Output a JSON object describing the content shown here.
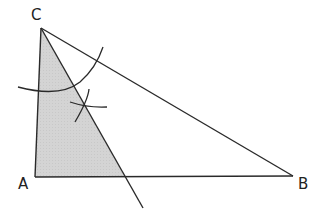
{
  "diagram": {
    "type": "geometric-construction",
    "vertices": {
      "A": {
        "label": "A"
      },
      "B": {
        "label": "B"
      },
      "C": {
        "label": "C"
      }
    },
    "shaded_region_color": "#d4d4d4",
    "line_color": "#2a2a2a"
  }
}
